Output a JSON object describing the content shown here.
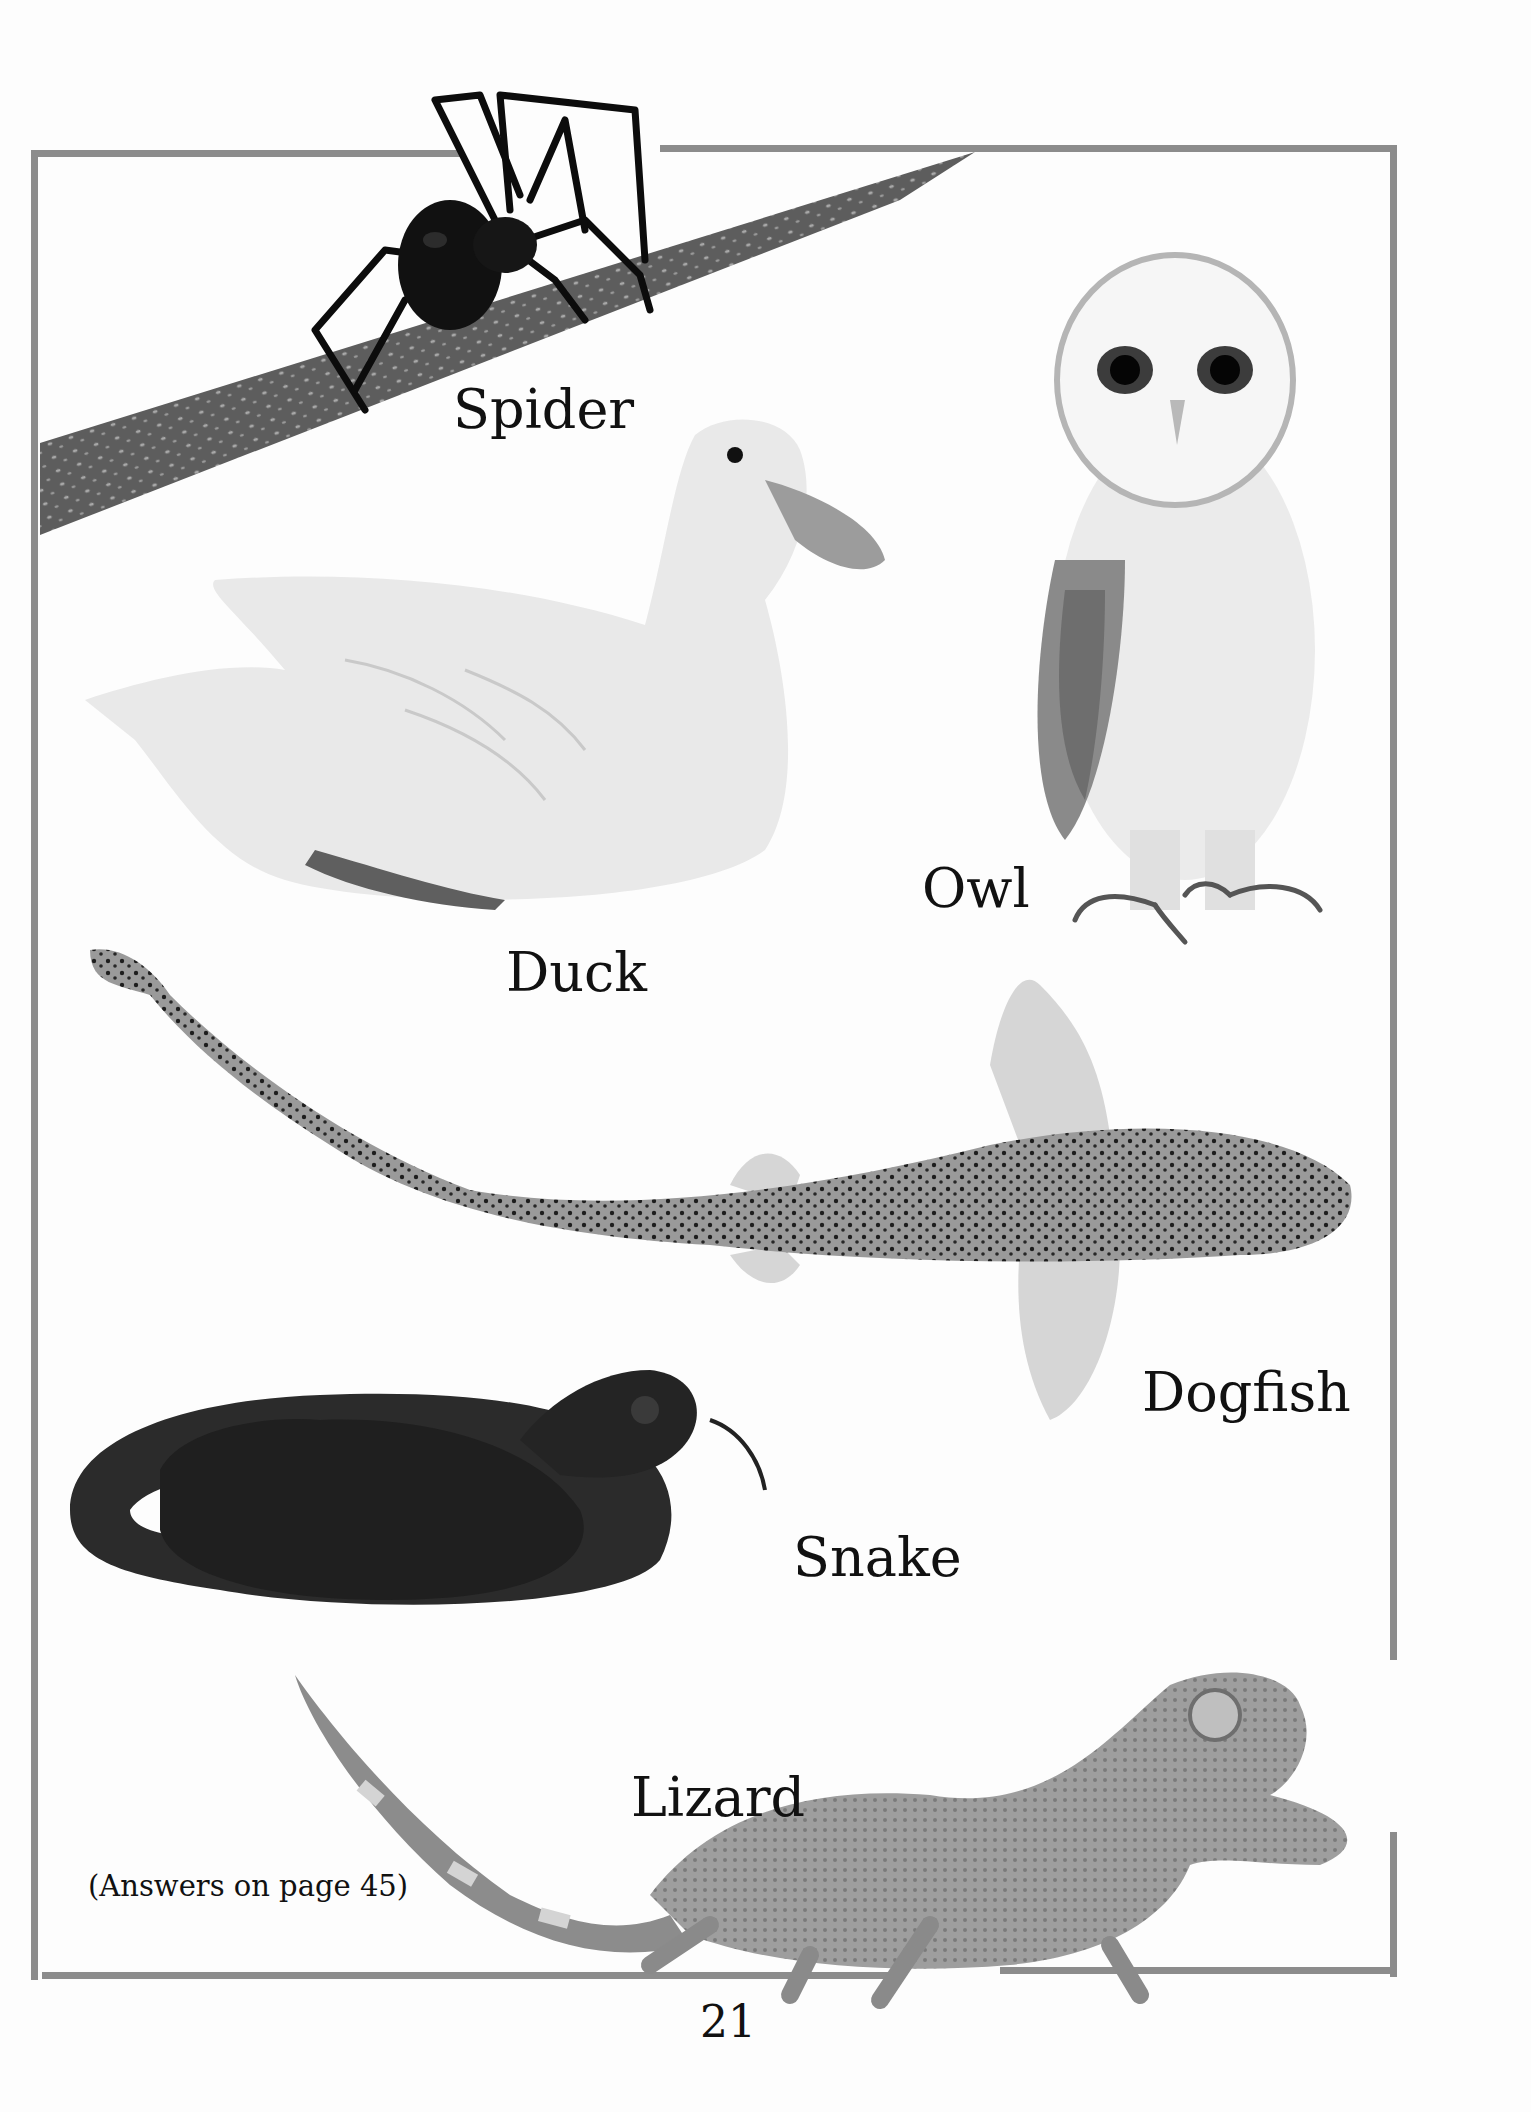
{
  "page": {
    "number": "21",
    "answers_note": "(Answers on page 45)",
    "frame_color": "#8c8c8c",
    "background": "#fdfdfd"
  },
  "animals": [
    {
      "id": "spider",
      "label": "Spider",
      "icon": "spider-photo"
    },
    {
      "id": "owl",
      "label": "Owl",
      "icon": "owl-photo"
    },
    {
      "id": "duck",
      "label": "Duck",
      "icon": "duck-photo"
    },
    {
      "id": "dogfish",
      "label": "Dogfish",
      "icon": "dogfish-photo"
    },
    {
      "id": "snake",
      "label": "Snake",
      "icon": "snake-photo"
    },
    {
      "id": "lizard",
      "label": "Lizard",
      "icon": "lizard-photo"
    }
  ]
}
